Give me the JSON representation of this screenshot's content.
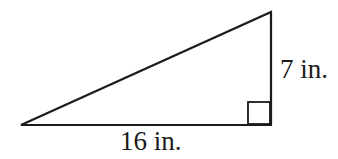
{
  "figure": {
    "type": "right-triangle",
    "labels": {
      "vertical_side": "7 in.",
      "base_side": "16 in."
    },
    "stroke_color": "#1b1b1b",
    "background_color": "#ffffff"
  }
}
